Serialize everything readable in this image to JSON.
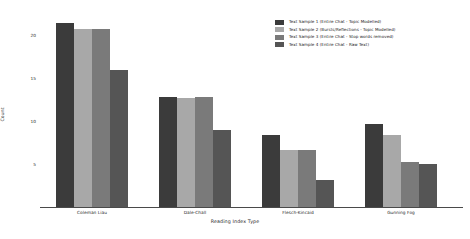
{
  "chart_data": {
    "type": "bar",
    "title": "",
    "xlabel": "Reading Index Type",
    "ylabel": "Count",
    "categories": [
      "Coleman Liau",
      "Dale-Chall",
      "Flesch-Kincaid",
      "Gunning Fog"
    ],
    "series": [
      {
        "name": "Text Sample 1 (Entire Chat - Topic Modelled)",
        "color": "#3b3b3b",
        "values": [
          21.5,
          12.8,
          8.4,
          9.7
        ]
      },
      {
        "name": "Text Sample 2 (Bursts/Reflections - Topic Modelled)",
        "color": "#a8a8a8",
        "values": [
          20.7,
          12.7,
          6.7,
          8.4
        ]
      },
      {
        "name": "Text Sample 3 (Entire Chat - Stop words removed)",
        "color": "#7a7a7a",
        "values": [
          20.7,
          12.8,
          6.7,
          5.3
        ]
      },
      {
        "name": "Text Sample 4 (Entire Chat - Raw Text)",
        "color": "#555555",
        "values": [
          16.0,
          9.0,
          3.1,
          5.0
        ]
      }
    ],
    "ylim": [
      0,
      22.5
    ],
    "yticks": [
      "5",
      "10",
      "15",
      "20"
    ],
    "ytick_values": [
      5,
      10,
      15,
      20
    ],
    "grid": false,
    "legend_position": "top-right",
    "background": "#ffffff"
  }
}
